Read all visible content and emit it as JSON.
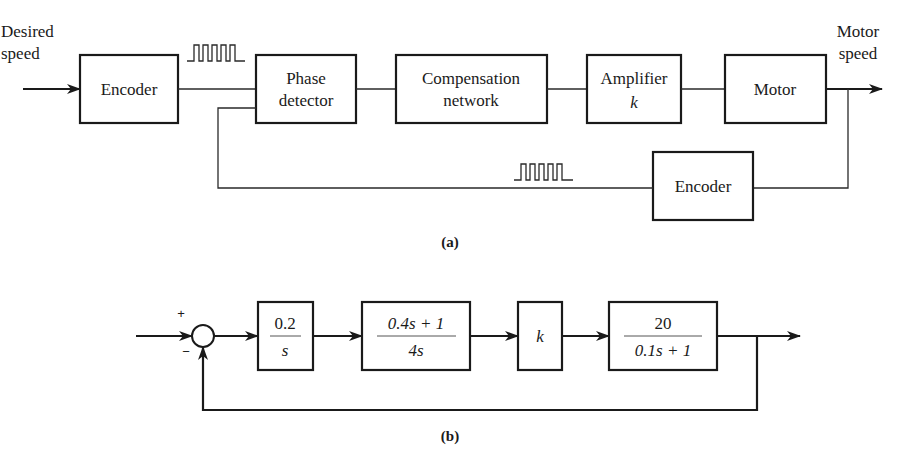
{
  "diagram_a": {
    "caption": "(a)",
    "input_label_line1": "Desired",
    "input_label_line2": "speed",
    "output_label_line1": "Motor",
    "output_label_line2": "speed",
    "blocks": {
      "encoder_forward": "Encoder",
      "phase_detector_line1": "Phase",
      "phase_detector_line2": "detector",
      "compensation_line1": "Compensation",
      "compensation_line2": "network",
      "amplifier_line1": "Amplifier",
      "amplifier_gain": "k",
      "motor": "Motor",
      "encoder_feedback": "Encoder"
    },
    "signals": [
      "pulse-train",
      "pulse-train"
    ]
  },
  "diagram_b": {
    "caption": "(b)",
    "sum_plus": "+",
    "sum_minus": "−",
    "blocks": [
      {
        "numerator": "0.2",
        "denominator": "s"
      },
      {
        "numerator": "0.4s + 1",
        "denominator": "4s"
      },
      {
        "gain": "k"
      },
      {
        "numerator": "20",
        "denominator": "0.1s + 1"
      }
    ]
  }
}
